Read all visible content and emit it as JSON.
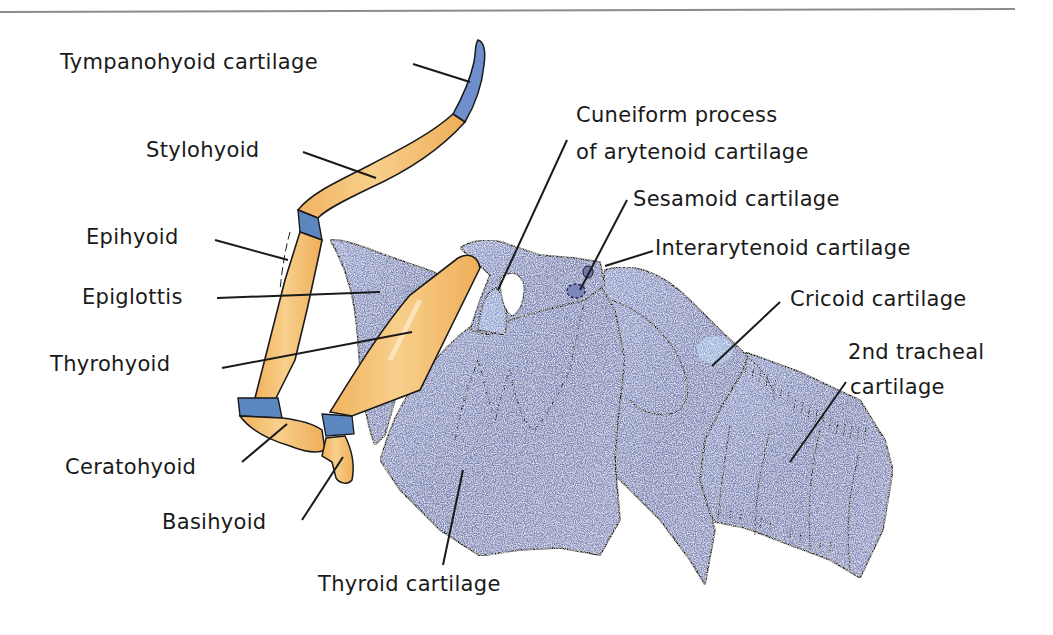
{
  "diagram": {
    "type": "anatomical-illustration",
    "colors": {
      "bone": "#f2b866",
      "bone_highlight": "#fbe0b0",
      "cartilage": "#7d86b8",
      "cartilage_light": "#9fb2dc",
      "cartilage_accent": "#5f8fcf",
      "joint_cartilage": "#5b86c0",
      "outline": "#1a1a1a",
      "rule_line": "#8c8c8c"
    },
    "labels": {
      "tympanohyoid": "Tympanohyoid cartilage",
      "stylohyoid": "Stylohyoid",
      "epihyoid": "Epihyoid",
      "epiglottis": "Epiglottis",
      "thyrohyoid": "Thyrohyoid",
      "ceratohyoid": "Ceratohyoid",
      "basihyoid": "Basihyoid",
      "thyroid": "Thyroid cartilage",
      "cuneiform_line1": "Cuneiform process",
      "cuneiform_line2": "of arytenoid cartilage",
      "sesamoid": "Sesamoid cartilage",
      "interarytenoid": "Interarytenoid cartilage",
      "cricoid": "Cricoid cartilage",
      "tracheal_line1": "2nd tracheal",
      "tracheal_line2": "cartilage"
    }
  }
}
